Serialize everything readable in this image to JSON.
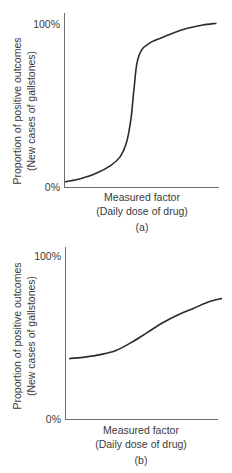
{
  "chart_data": [
    {
      "type": "line",
      "panel_label": "(a)",
      "title": "",
      "xlabel": "Measured factor",
      "xlabel_sub": "(Daily dose of drug)",
      "ylabel": "Proportion of positive outcomes",
      "ylabel_sub": "(New cases of gallstones)",
      "yticks": [
        "0%",
        "100%"
      ],
      "ylim": [
        0,
        100
      ],
      "xlim": [
        0,
        100
      ],
      "grid": false,
      "legend": null,
      "line_color": "#2b2b2b",
      "series": [
        {
          "name": "Steep sigmoid response",
          "x": [
            0,
            10,
            20,
            30,
            36,
            40,
            43,
            45,
            47,
            50,
            55,
            62,
            70,
            80,
            90,
            99
          ],
          "y": [
            3,
            5,
            8,
            13,
            18,
            26,
            40,
            58,
            74,
            82,
            86,
            89,
            92,
            95,
            97,
            98
          ]
        }
      ]
    },
    {
      "type": "line",
      "panel_label": "(b)",
      "title": "",
      "xlabel": "Measured factor",
      "xlabel_sub": "(Daily dose of drug)",
      "ylabel": "Proportion of positive outcomes",
      "ylabel_sub": "(New cases of gallstones)",
      "yticks": [
        "0%",
        "100%"
      ],
      "ylim": [
        0,
        100
      ],
      "xlim": [
        0,
        100
      ],
      "grid": false,
      "legend": null,
      "line_color": "#2b2b2b",
      "series": [
        {
          "name": "Gradual response",
          "x": [
            2,
            12,
            22,
            32,
            42,
            52,
            62,
            72,
            82,
            92,
            100
          ],
          "y": [
            37,
            38,
            39.5,
            42,
            47,
            53,
            59,
            64,
            68,
            72,
            74
          ]
        }
      ]
    }
  ]
}
